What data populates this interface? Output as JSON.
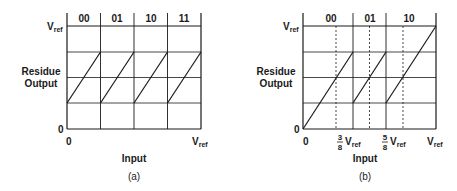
{
  "panel_a": {
    "caption": "(a)",
    "y_label_line1": "Residue",
    "y_label_line2": "Output",
    "x_label": "Input",
    "y_top_label": "V",
    "y_top_sub": "ref",
    "y_zero": "0",
    "x_zero": "0",
    "x_right_label": "V",
    "x_right_sub": "ref",
    "codes": [
      "00",
      "01",
      "10",
      "11"
    ]
  },
  "panel_b": {
    "caption": "(b)",
    "y_label_line1": "Residue",
    "y_label_line2": "Output",
    "x_label": "Input",
    "y_top_label": "V",
    "y_top_sub": "ref",
    "y_zero": "0",
    "x_zero": "0",
    "x_right_label": "V",
    "x_right_sub": "ref",
    "tick1_num": "3",
    "tick1_den": "8",
    "tick1_label": "V",
    "tick1_sub": "ref",
    "tick2_num": "5",
    "tick2_den": "8",
    "tick2_label": "V",
    "tick2_sub": "ref",
    "codes": [
      "00",
      "01",
      "10"
    ]
  },
  "colors": {
    "line": "#1a1a1a",
    "background": "#ffffff"
  }
}
